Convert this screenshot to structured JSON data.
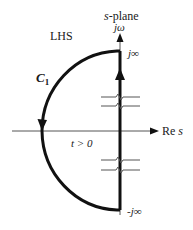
{
  "diagram": {
    "title": "s-plane",
    "axes": {
      "imaginary_label": "jω",
      "real_label": "Re s"
    },
    "region_label": "LHS",
    "contour_label": "C",
    "contour_subscript": "1",
    "condition_label": "t > 0",
    "top_limit_label": "j∞",
    "bottom_limit_label": "-j∞",
    "colors": {
      "contour": "#111111",
      "axis": "#555555",
      "text": "#1a1a1a"
    }
  }
}
